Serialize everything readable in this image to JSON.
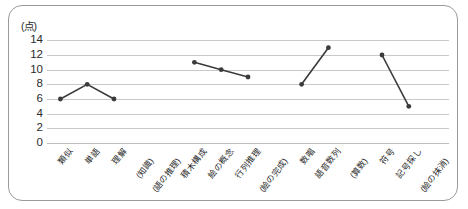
{
  "chart": {
    "type": "line",
    "unit_label": "(点)",
    "y_ticks": [
      0,
      2,
      4,
      6,
      8,
      10,
      12,
      14
    ],
    "ylim": [
      0,
      15
    ]
  },
  "chart_data": {
    "type": "line",
    "title": "",
    "xlabel": "",
    "ylabel": "(点)",
    "ylim": [
      0,
      15
    ],
    "y_ticks": [
      0,
      2,
      4,
      6,
      8,
      10,
      12,
      14
    ],
    "grid": true,
    "legend": "none",
    "categories": [
      "類似",
      "単語",
      "理解",
      "(知識)",
      "(語の推理)",
      "積木構成",
      "絵の概念",
      "行列推理",
      "(絵の完成)",
      "数唱",
      "語音数列",
      "(算数)",
      "符号",
      "記号探し",
      "(絵の抹消)"
    ],
    "values": [
      6,
      8,
      6,
      null,
      null,
      11,
      10,
      9,
      null,
      8,
      13,
      null,
      12,
      5,
      null
    ],
    "series": [
      {
        "name": "評価点",
        "points": [
          {
            "category": "類似",
            "value": 6
          },
          {
            "category": "単語",
            "value": 8
          },
          {
            "category": "理解",
            "value": 6
          },
          {
            "category": "(知識)",
            "value": null
          },
          {
            "category": "(語の推理)",
            "value": null
          },
          {
            "category": "積木構成",
            "value": 11
          },
          {
            "category": "絵の概念",
            "value": 10
          },
          {
            "category": "行列推理",
            "value": 9
          },
          {
            "category": "(絵の完成)",
            "value": null
          },
          {
            "category": "数唱",
            "value": 8
          },
          {
            "category": "語音数列",
            "value": 13
          },
          {
            "category": "(算数)",
            "value": null
          },
          {
            "category": "符号",
            "value": 12
          },
          {
            "category": "記号探し",
            "value": 5
          },
          {
            "category": "(絵の抹消)",
            "value": null
          }
        ]
      }
    ],
    "segments": [
      [
        6,
        8,
        6
      ],
      [
        11,
        10,
        9
      ],
      [
        8,
        13
      ],
      [
        12,
        5
      ]
    ],
    "marker_color": "#3b3b3b",
    "line_color": "#3b3b3b",
    "grid_color": "#c9c9c9"
  },
  "colors": {
    "frame": "#9a9a9a",
    "grid": "#c9c9c9",
    "line": "#3b3b3b",
    "text": "#2b2b2b",
    "background": "#ffffff"
  }
}
